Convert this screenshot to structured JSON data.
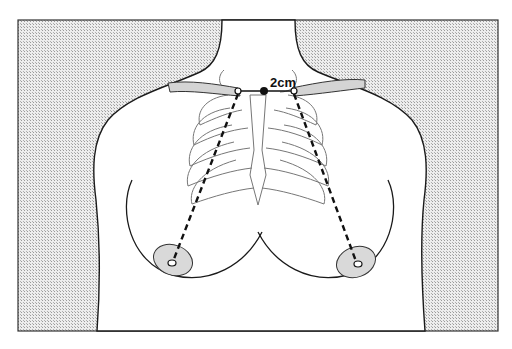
{
  "figure": {
    "type": "anatomical-diagram",
    "labels": {
      "distance": "2cm"
    },
    "colors": {
      "background_hatch": "#cfcfcf",
      "outline": "#1a1a1a",
      "bone_fill": "#d4d4d4",
      "areola_fill": "#d9d9d9",
      "rib_outline": "#777777"
    },
    "measurement_lines": [
      {
        "name": "left-sternal-notch-to-nipple",
        "style": "dashed"
      },
      {
        "name": "right-sternal-notch-to-nipple",
        "style": "dashed"
      }
    ]
  }
}
